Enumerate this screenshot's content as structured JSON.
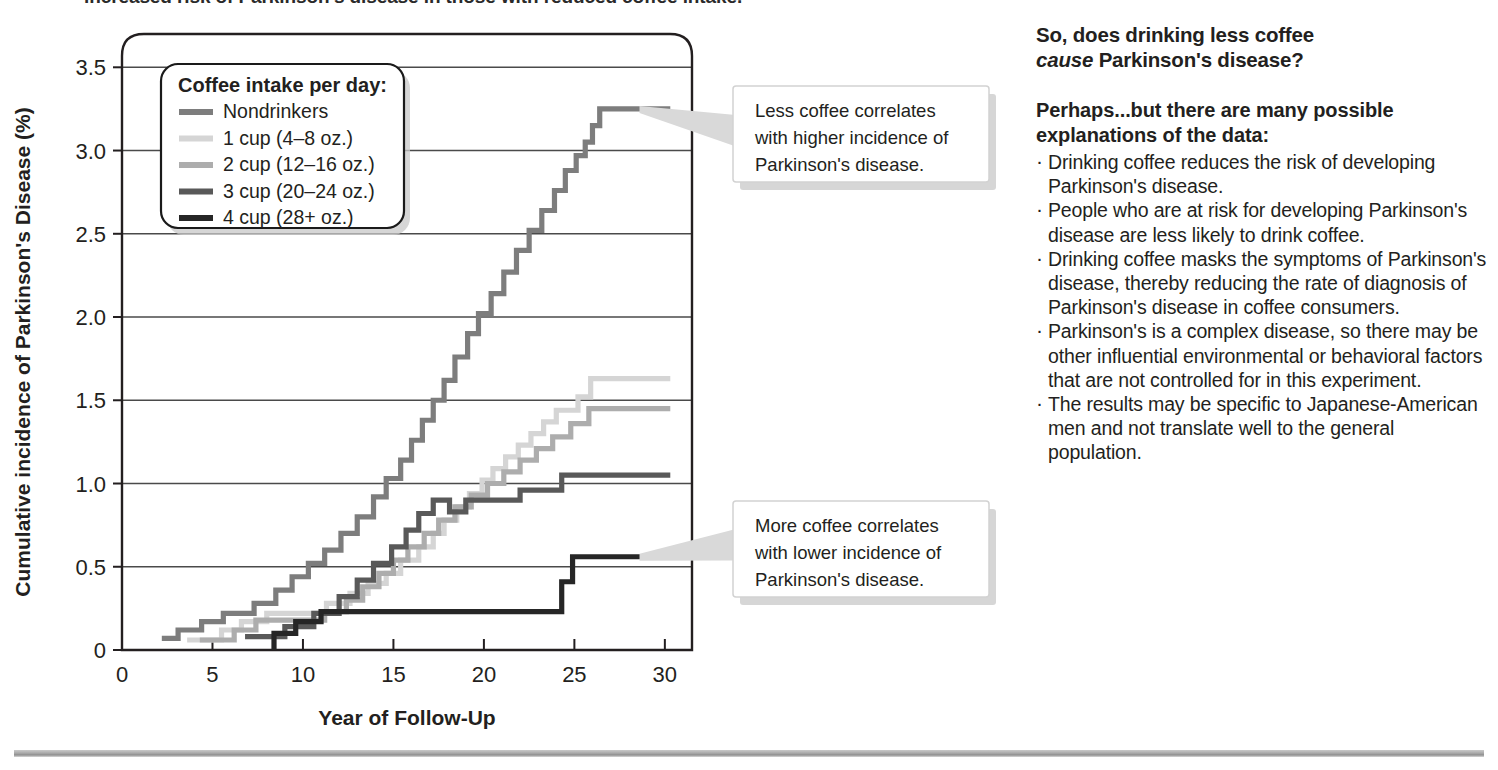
{
  "top_cropped_line": "increased risk of Parkinson's disease in those with reduced coffee intake.",
  "chart_data": {
    "type": "line",
    "subtype": "step",
    "title": "",
    "xlabel": "Year of Follow-Up",
    "ylabel": "Cumulative incidence of Parkinson's Disease (%)",
    "xlim": [
      0,
      31.5
    ],
    "ylim": [
      0,
      3.7
    ],
    "xticks": [
      "0",
      "5",
      "10",
      "15",
      "20",
      "25",
      "30"
    ],
    "xtick_values": [
      0,
      5,
      10,
      15,
      20,
      25,
      30
    ],
    "yticks": [
      "0",
      "0.5",
      "1.0",
      "1.5",
      "2.0",
      "2.5",
      "3.0",
      "3.5"
    ],
    "ytick_values": [
      0,
      0.5,
      1.0,
      1.5,
      2.0,
      2.5,
      3.0,
      3.5
    ],
    "grid": "horizontal",
    "legend_position": "top-left-inset",
    "source": "Data from Ross, G.W. et.al. (2000) JAMA 283:2671-2679.",
    "series": [
      {
        "name": "Nondrinkers",
        "color": "#7d7d7d",
        "final_value": 3.25,
        "points": [
          [
            2.2,
            0.07
          ],
          [
            3.1,
            0.07
          ],
          [
            3.1,
            0.12
          ],
          [
            4.4,
            0.12
          ],
          [
            4.4,
            0.17
          ],
          [
            5.6,
            0.17
          ],
          [
            5.6,
            0.22
          ],
          [
            7.3,
            0.22
          ],
          [
            7.3,
            0.28
          ],
          [
            8.5,
            0.28
          ],
          [
            8.5,
            0.36
          ],
          [
            9.4,
            0.36
          ],
          [
            9.4,
            0.44
          ],
          [
            10.3,
            0.44
          ],
          [
            10.3,
            0.52
          ],
          [
            11.2,
            0.52
          ],
          [
            11.2,
            0.6
          ],
          [
            12.1,
            0.6
          ],
          [
            12.1,
            0.7
          ],
          [
            13.0,
            0.7
          ],
          [
            13.0,
            0.8
          ],
          [
            13.9,
            0.8
          ],
          [
            13.9,
            0.92
          ],
          [
            14.6,
            0.92
          ],
          [
            14.6,
            1.03
          ],
          [
            15.4,
            1.03
          ],
          [
            15.4,
            1.14
          ],
          [
            16.0,
            1.14
          ],
          [
            16.0,
            1.26
          ],
          [
            16.6,
            1.26
          ],
          [
            16.6,
            1.38
          ],
          [
            17.2,
            1.38
          ],
          [
            17.2,
            1.5
          ],
          [
            17.8,
            1.5
          ],
          [
            17.8,
            1.62
          ],
          [
            18.4,
            1.62
          ],
          [
            18.4,
            1.76
          ],
          [
            19.1,
            1.76
          ],
          [
            19.1,
            1.9
          ],
          [
            19.7,
            1.9
          ],
          [
            19.7,
            2.02
          ],
          [
            20.4,
            2.02
          ],
          [
            20.4,
            2.14
          ],
          [
            21.1,
            2.14
          ],
          [
            21.1,
            2.27
          ],
          [
            21.8,
            2.27
          ],
          [
            21.8,
            2.4
          ],
          [
            22.5,
            2.4
          ],
          [
            22.5,
            2.52
          ],
          [
            23.2,
            2.52
          ],
          [
            23.2,
            2.64
          ],
          [
            23.9,
            2.64
          ],
          [
            23.9,
            2.76
          ],
          [
            24.5,
            2.76
          ],
          [
            24.5,
            2.88
          ],
          [
            25.1,
            2.88
          ],
          [
            25.1,
            2.97
          ],
          [
            25.6,
            2.97
          ],
          [
            25.6,
            3.05
          ],
          [
            26.0,
            3.05
          ],
          [
            26.0,
            3.15
          ],
          [
            26.4,
            3.15
          ],
          [
            26.4,
            3.25
          ],
          [
            27.2,
            3.25
          ],
          [
            30.3,
            3.25
          ]
        ]
      },
      {
        "name": "1 cup (4–8 oz.)",
        "color": "#d5d5d5",
        "final_value": 1.63,
        "points": [
          [
            3.6,
            0.06
          ],
          [
            5.5,
            0.06
          ],
          [
            5.5,
            0.12
          ],
          [
            6.6,
            0.12
          ],
          [
            6.6,
            0.17
          ],
          [
            8.0,
            0.17
          ],
          [
            8.0,
            0.22
          ],
          [
            11.3,
            0.22
          ],
          [
            11.3,
            0.28
          ],
          [
            12.6,
            0.28
          ],
          [
            12.6,
            0.34
          ],
          [
            13.6,
            0.34
          ],
          [
            13.6,
            0.4
          ],
          [
            14.6,
            0.4
          ],
          [
            14.6,
            0.46
          ],
          [
            15.4,
            0.46
          ],
          [
            15.4,
            0.54
          ],
          [
            16.4,
            0.54
          ],
          [
            16.4,
            0.62
          ],
          [
            17.2,
            0.62
          ],
          [
            17.2,
            0.7
          ],
          [
            17.8,
            0.7
          ],
          [
            17.8,
            0.78
          ],
          [
            18.5,
            0.78
          ],
          [
            18.5,
            0.86
          ],
          [
            19.2,
            0.86
          ],
          [
            19.2,
            0.94
          ],
          [
            19.9,
            0.94
          ],
          [
            19.9,
            1.02
          ],
          [
            20.5,
            1.02
          ],
          [
            20.5,
            1.09
          ],
          [
            21.2,
            1.09
          ],
          [
            21.2,
            1.16
          ],
          [
            21.9,
            1.16
          ],
          [
            21.9,
            1.23
          ],
          [
            22.6,
            1.23
          ],
          [
            22.6,
            1.3
          ],
          [
            23.3,
            1.3
          ],
          [
            23.3,
            1.37
          ],
          [
            24.0,
            1.37
          ],
          [
            24.0,
            1.44
          ],
          [
            25.2,
            1.44
          ],
          [
            25.2,
            1.52
          ],
          [
            25.9,
            1.52
          ],
          [
            25.9,
            1.63
          ],
          [
            26.6,
            1.63
          ],
          [
            30.3,
            1.63
          ]
        ]
      },
      {
        "name": "2 cup (12–16 oz.)",
        "color": "#adadad",
        "final_value": 1.45,
        "points": [
          [
            4.3,
            0.06
          ],
          [
            6.2,
            0.06
          ],
          [
            6.2,
            0.12
          ],
          [
            7.4,
            0.12
          ],
          [
            7.4,
            0.18
          ],
          [
            11.2,
            0.18
          ],
          [
            11.2,
            0.23
          ],
          [
            12.4,
            0.23
          ],
          [
            12.4,
            0.3
          ],
          [
            13.3,
            0.3
          ],
          [
            13.3,
            0.38
          ],
          [
            14.2,
            0.38
          ],
          [
            14.2,
            0.46
          ],
          [
            15.0,
            0.46
          ],
          [
            15.0,
            0.54
          ],
          [
            15.8,
            0.54
          ],
          [
            15.8,
            0.62
          ],
          [
            16.7,
            0.62
          ],
          [
            16.7,
            0.7
          ],
          [
            17.5,
            0.7
          ],
          [
            17.5,
            0.78
          ],
          [
            18.4,
            0.78
          ],
          [
            18.4,
            0.86
          ],
          [
            19.3,
            0.86
          ],
          [
            19.3,
            0.93
          ],
          [
            20.2,
            0.93
          ],
          [
            20.2,
            1.0
          ],
          [
            21.1,
            1.0
          ],
          [
            21.1,
            1.07
          ],
          [
            22.0,
            1.07
          ],
          [
            22.0,
            1.14
          ],
          [
            22.9,
            1.14
          ],
          [
            22.9,
            1.21
          ],
          [
            23.8,
            1.21
          ],
          [
            23.8,
            1.28
          ],
          [
            24.8,
            1.28
          ],
          [
            24.8,
            1.36
          ],
          [
            25.8,
            1.36
          ],
          [
            25.8,
            1.45
          ],
          [
            26.8,
            1.45
          ],
          [
            30.3,
            1.45
          ]
        ]
      },
      {
        "name": "3 cup (20–24 oz.)",
        "color": "#595959",
        "final_value": 1.05,
        "points": [
          [
            6.8,
            0.08
          ],
          [
            9.0,
            0.08
          ],
          [
            9.0,
            0.14
          ],
          [
            10.6,
            0.14
          ],
          [
            10.6,
            0.22
          ],
          [
            12.0,
            0.22
          ],
          [
            12.0,
            0.32
          ],
          [
            13.0,
            0.32
          ],
          [
            13.0,
            0.42
          ],
          [
            13.9,
            0.42
          ],
          [
            13.9,
            0.52
          ],
          [
            14.9,
            0.52
          ],
          [
            14.9,
            0.62
          ],
          [
            15.7,
            0.62
          ],
          [
            15.7,
            0.72
          ],
          [
            16.4,
            0.72
          ],
          [
            16.4,
            0.82
          ],
          [
            17.2,
            0.82
          ],
          [
            17.2,
            0.9
          ],
          [
            18.1,
            0.9
          ],
          [
            18.1,
            0.83
          ],
          [
            19.0,
            0.83
          ],
          [
            19.0,
            0.9
          ],
          [
            22.0,
            0.9
          ],
          [
            22.0,
            0.96
          ],
          [
            24.3,
            0.96
          ],
          [
            24.3,
            1.05
          ],
          [
            26.0,
            1.05
          ],
          [
            30.3,
            1.05
          ]
        ]
      },
      {
        "name": "4 cup (28+ oz.)",
        "color": "#262626",
        "final_value": 0.56,
        "points": [
          [
            8.4,
            0.0
          ],
          [
            8.4,
            0.1
          ],
          [
            9.6,
            0.1
          ],
          [
            9.6,
            0.17
          ],
          [
            11.0,
            0.17
          ],
          [
            11.0,
            0.23
          ],
          [
            13.0,
            0.23
          ],
          [
            13.0,
            0.23
          ],
          [
            24.3,
            0.23
          ],
          [
            24.3,
            0.41
          ],
          [
            24.9,
            0.41
          ],
          [
            24.9,
            0.56
          ],
          [
            25.6,
            0.56
          ],
          [
            30.3,
            0.56
          ]
        ]
      }
    ]
  },
  "legend": {
    "title": "Coffee intake per day:",
    "items": [
      {
        "label": "Nondrinkers",
        "color": "#7d7d7d"
      },
      {
        "label": "1 cup (4–8 oz.)",
        "color": "#d5d5d5"
      },
      {
        "label": "2 cup (12–16 oz.)",
        "color": "#adadad"
      },
      {
        "label": "3 cup (20–24 oz.)",
        "color": "#595959"
      },
      {
        "label": "4 cup (28+ oz.)",
        "color": "#262626"
      }
    ]
  },
  "callouts": [
    {
      "id": "upper",
      "lines": [
        "Less coffee correlates",
        "with higher incidence of",
        "Parkinson's disease."
      ]
    },
    {
      "id": "lower",
      "lines": [
        "More coffee correlates",
        "with lower incidence of",
        "Parkinson's disease."
      ]
    }
  ],
  "sidebar": {
    "heading_line1": "So, does drinking less coffee",
    "heading_em": "cause",
    "heading_line2_rest": " Parkinson's disease?",
    "lead_line1": "Perhaps...but there are many possible",
    "lead_line2": "explanations of the data:",
    "bullets": [
      "Drinking coffee reduces the risk of developing Parkinson's disease.",
      "People who are at risk for developing Parkinson's disease are less likely to drink coffee.",
      "Drinking coffee masks the symptoms of Parkinson's disease, thereby reducing the rate of diagnosis of Parkinson's disease in coffee consumers.",
      "Parkinson's is a complex disease, so there may be other influential environmental or behavioral factors that are not controlled for in this experiment.",
      "The results may be specific to Japanese-American men and not translate well to the general population."
    ]
  },
  "colors": {
    "text": "#231f20",
    "axis": "#231f20",
    "grid": "#4a4a4a",
    "rule": "#a9a9a9"
  }
}
